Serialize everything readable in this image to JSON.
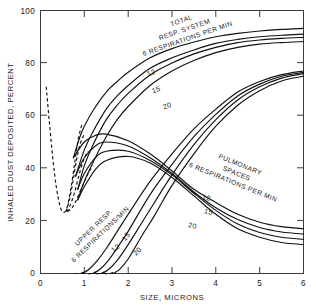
{
  "chart_data": {
    "type": "line",
    "title": "",
    "xlabel": "SIZE, MICRONS",
    "ylabel": "INHALED DUST DEPOSITED, PERCENT",
    "xlim": [
      0,
      6
    ],
    "ylim": [
      0,
      100
    ],
    "xticks": [
      "0",
      "1",
      "2",
      "3",
      "4",
      "5",
      "6"
    ],
    "yticks": [
      "0",
      "20",
      "40",
      "60",
      "80",
      "100"
    ],
    "grid": false,
    "legend_position": "inline-curve-labels",
    "annotations": [
      {
        "name": "total-resp-system-label",
        "lines": [
          "TOTAL",
          "RESP. SYSTEM",
          "6 RESPIRATIONS PER MIN"
        ]
      },
      {
        "name": "pulmonary-spaces-label",
        "lines": [
          "PULMONARY",
          "SPACES",
          "6 RESPIRATIONS PER MIN"
        ]
      },
      {
        "name": "upper-resp-label",
        "lines": [
          "UPPER  RESP.",
          "6 RESPIRATIONS/MIN"
        ]
      }
    ],
    "group_labels": {
      "total": {
        "l1": "TOTAL",
        "l2": "RESP. SYSTEM",
        "l3": "6 RESPIRATIONS PER MIN"
      },
      "pulmonary": {
        "l1": "PULMONARY",
        "l2": "SPACES",
        "l3": "6 RESPIRATIONS PER MIN"
      },
      "upper": {
        "l1": "UPPER  RESP.",
        "l2": "6 RESPIRATIONS/MIN"
      }
    },
    "curve_labels": {
      "total_12": "12",
      "total_15": "15",
      "total_20": "20",
      "pulmonary_12": "12",
      "pulmonary_15": "15",
      "pulmonary_20": "20",
      "upper_12": "12",
      "upper_15": "15",
      "upper_20": "20"
    },
    "series": [
      {
        "name": "Total resp. system, 6 respirations/min",
        "group": "total",
        "respirations_per_min": 6,
        "style": "solid",
        "x": [
          0.75,
          0.9,
          1.0,
          1.2,
          1.5,
          1.75,
          2.0,
          2.5,
          3.0,
          3.5,
          4.0,
          4.5,
          5.0,
          5.5,
          6.0
        ],
        "y": [
          44,
          52,
          56,
          62,
          69,
          73,
          76.5,
          82,
          85.5,
          88,
          90,
          91.3,
          92.2,
          92.8,
          93.2
        ]
      },
      {
        "name": "Total resp. system, 12 respirations/min",
        "group": "total",
        "respirations_per_min": 12,
        "style": "solid",
        "x": [
          0.8,
          1.0,
          1.2,
          1.5,
          1.75,
          2.0,
          2.5,
          3.0,
          3.5,
          4.0,
          4.5,
          5.0,
          5.5,
          6.0
        ],
        "y": [
          37,
          47,
          54,
          62.5,
          67.5,
          71.5,
          78,
          82,
          85,
          87.5,
          89,
          90,
          90.6,
          91.0
        ]
      },
      {
        "name": "Total resp. system, 15 respirations/min",
        "group": "total",
        "respirations_per_min": 15,
        "style": "solid",
        "x": [
          0.85,
          1.0,
          1.2,
          1.5,
          1.75,
          2.0,
          2.5,
          3.0,
          3.5,
          4.0,
          4.5,
          5.0,
          5.5,
          6.0
        ],
        "y": [
          32,
          41,
          49,
          58.5,
          64,
          68.5,
          75.5,
          80,
          83.5,
          86,
          87.8,
          88.8,
          89.4,
          89.8
        ]
      },
      {
        "name": "Total resp. system, 20 respirations/min",
        "group": "total",
        "respirations_per_min": 20,
        "style": "solid",
        "x": [
          0.85,
          1.0,
          1.25,
          1.5,
          1.75,
          2.0,
          2.5,
          3.0,
          3.5,
          4.0,
          4.5,
          5.0,
          5.5,
          6.0
        ],
        "y": [
          28,
          35,
          44,
          52,
          58.5,
          63.5,
          71.5,
          77,
          81,
          84,
          86,
          87.2,
          87.8,
          88.2
        ]
      },
      {
        "name": "Pulmonary spaces, 6 respirations/min",
        "group": "pulmonary",
        "respirations_per_min": 6,
        "style": "solid",
        "x": [
          0.75,
          1.0,
          1.25,
          1.5,
          2.0,
          2.5,
          3.0,
          3.5,
          4.0,
          4.5,
          5.0,
          5.5,
          6.0
        ],
        "y": [
          44,
          50,
          52.5,
          53,
          50.5,
          45.5,
          39,
          32,
          27,
          22.5,
          19.5,
          17.8,
          17.0
        ]
      },
      {
        "name": "Pulmonary spaces, 12 respirations/min",
        "group": "pulmonary",
        "respirations_per_min": 12,
        "style": "solid",
        "x": [
          0.8,
          1.0,
          1.25,
          1.5,
          2.0,
          2.5,
          3.0,
          3.5,
          4.0,
          4.5,
          5.0,
          5.5,
          6.0
        ],
        "y": [
          37,
          44,
          48.5,
          50,
          48.5,
          44,
          38,
          31,
          25,
          20.5,
          17.5,
          15.8,
          15.0
        ]
      },
      {
        "name": "Pulmonary spaces, 15 respirations/min",
        "group": "pulmonary",
        "respirations_per_min": 15,
        "style": "solid",
        "x": [
          0.85,
          1.0,
          1.25,
          1.5,
          2.0,
          2.5,
          3.0,
          3.5,
          4.0,
          4.5,
          5.0,
          5.5,
          6.0
        ],
        "y": [
          32,
          38,
          44,
          46.5,
          46.5,
          43,
          37.5,
          30.5,
          24,
          18.8,
          15.6,
          13.8,
          13.0
        ]
      },
      {
        "name": "Pulmonary spaces, 20 respirations/min",
        "group": "pulmonary",
        "respirations_per_min": 20,
        "style": "solid",
        "x": [
          0.85,
          1.0,
          1.25,
          1.5,
          2.0,
          2.5,
          3.0,
          3.5,
          4.0,
          4.5,
          5.0,
          5.5,
          6.0
        ],
        "y": [
          28,
          33,
          39.5,
          43,
          44.5,
          42,
          36.5,
          29.5,
          22.5,
          17.0,
          13.8,
          11.8,
          11.0
        ]
      },
      {
        "name": "Upper resp., 6 respirations/min",
        "group": "upper",
        "respirations_per_min": 6,
        "style": "solid",
        "x": [
          0.95,
          1.1,
          1.3,
          1.5,
          1.75,
          2.0,
          2.5,
          3.0,
          3.5,
          4.0,
          4.5,
          5.0,
          5.5,
          6.0
        ],
        "y": [
          0,
          1.5,
          5,
          9.5,
          16,
          22.5,
          35,
          45.5,
          55,
          62.5,
          69,
          73,
          75.6,
          77.0
        ]
      },
      {
        "name": "Upper resp., 12 respirations/min",
        "group": "upper",
        "respirations_per_min": 12,
        "style": "solid",
        "x": [
          1.2,
          1.35,
          1.55,
          1.8,
          2.0,
          2.5,
          3.0,
          3.5,
          4.0,
          4.5,
          5.0,
          5.5,
          6.0
        ],
        "y": [
          0,
          1.5,
          5,
          11,
          16,
          30,
          41.5,
          52,
          60.5,
          67.5,
          72,
          75,
          76.5
        ]
      },
      {
        "name": "Upper resp., 15 respirations/min",
        "group": "upper",
        "respirations_per_min": 15,
        "style": "solid",
        "x": [
          1.4,
          1.55,
          1.75,
          2.0,
          2.3,
          2.6,
          3.0,
          3.5,
          4.0,
          4.5,
          5.0,
          5.5,
          6.0
        ],
        "y": [
          0,
          1.5,
          5,
          11,
          19,
          27,
          37.5,
          49,
          58.5,
          66,
          71,
          74.3,
          76.0
        ]
      },
      {
        "name": "Upper resp., 20 respirations/min",
        "group": "upper",
        "respirations_per_min": 20,
        "style": "solid",
        "x": [
          1.65,
          1.8,
          2.0,
          2.3,
          2.6,
          3.0,
          3.5,
          4.0,
          4.5,
          5.0,
          5.5,
          6.0
        ],
        "y": [
          0,
          1.5,
          5.5,
          14,
          22,
          33.5,
          45.5,
          56,
          64,
          69.5,
          73.2,
          75.0
        ]
      },
      {
        "name": "Extrapolated small-size branch (dashed)",
        "group": "dashed",
        "respirations_per_min": null,
        "style": "dashed",
        "x": [
          0.13,
          0.2,
          0.28,
          0.36,
          0.44,
          0.5,
          0.56,
          0.62,
          0.7,
          0.78,
          0.86,
          0.95
        ],
        "y": [
          71,
          58,
          44,
          33,
          26,
          23.5,
          23.5,
          26,
          33,
          42,
          51,
          57
        ]
      },
      {
        "name": "Extrapolated branch to 12 min curve (dashed)",
        "group": "dashed",
        "respirations_per_min": 12,
        "style": "dashed",
        "x": [
          0.58,
          0.66,
          0.74,
          0.82,
          0.9,
          1.0
        ],
        "y": [
          23.5,
          28,
          35,
          43,
          49,
          53
        ]
      },
      {
        "name": "Extrapolated branch to 15 min curve (dashed)",
        "group": "dashed",
        "respirations_per_min": 15,
        "style": "dashed",
        "x": [
          0.6,
          0.68,
          0.78,
          0.88,
          0.98,
          1.08
        ],
        "y": [
          23.5,
          26,
          31,
          37.5,
          43,
          46.5
        ]
      },
      {
        "name": "Extrapolated branch to 20 min curve (dashed)",
        "group": "dashed",
        "respirations_per_min": 20,
        "style": "dashed",
        "x": [
          0.62,
          0.72,
          0.82,
          0.95,
          1.1,
          1.2
        ],
        "y": [
          23.5,
          25,
          28,
          33,
          38.5,
          41
        ]
      },
      {
        "name": "Upper resp. 6/min onset (dashed)",
        "group": "dashed-onset",
        "respirations_per_min": 6,
        "style": "dashed",
        "x": [
          0.78,
          0.85,
          0.92,
          0.98
        ],
        "y": [
          0,
          0,
          0,
          0.6
        ]
      },
      {
        "name": "Upper resp. 12/min onset (dashed)",
        "group": "dashed-onset",
        "respirations_per_min": 12,
        "style": "dashed",
        "x": [
          0.95,
          1.05,
          1.15,
          1.25
        ],
        "y": [
          0,
          0,
          0,
          0.6
        ]
      },
      {
        "name": "Upper resp. 15/min onset (dashed)",
        "group": "dashed-onset",
        "respirations_per_min": 15,
        "style": "dashed",
        "x": [
          1.12,
          1.25,
          1.38,
          1.48
        ],
        "y": [
          0,
          0,
          0,
          0.8
        ]
      },
      {
        "name": "Upper resp. 20/min onset (dashed)",
        "group": "dashed-onset",
        "respirations_per_min": 20,
        "style": "dashed",
        "x": [
          1.32,
          1.45,
          1.58,
          1.72
        ],
        "y": [
          0,
          0,
          0,
          0.8
        ]
      }
    ]
  }
}
